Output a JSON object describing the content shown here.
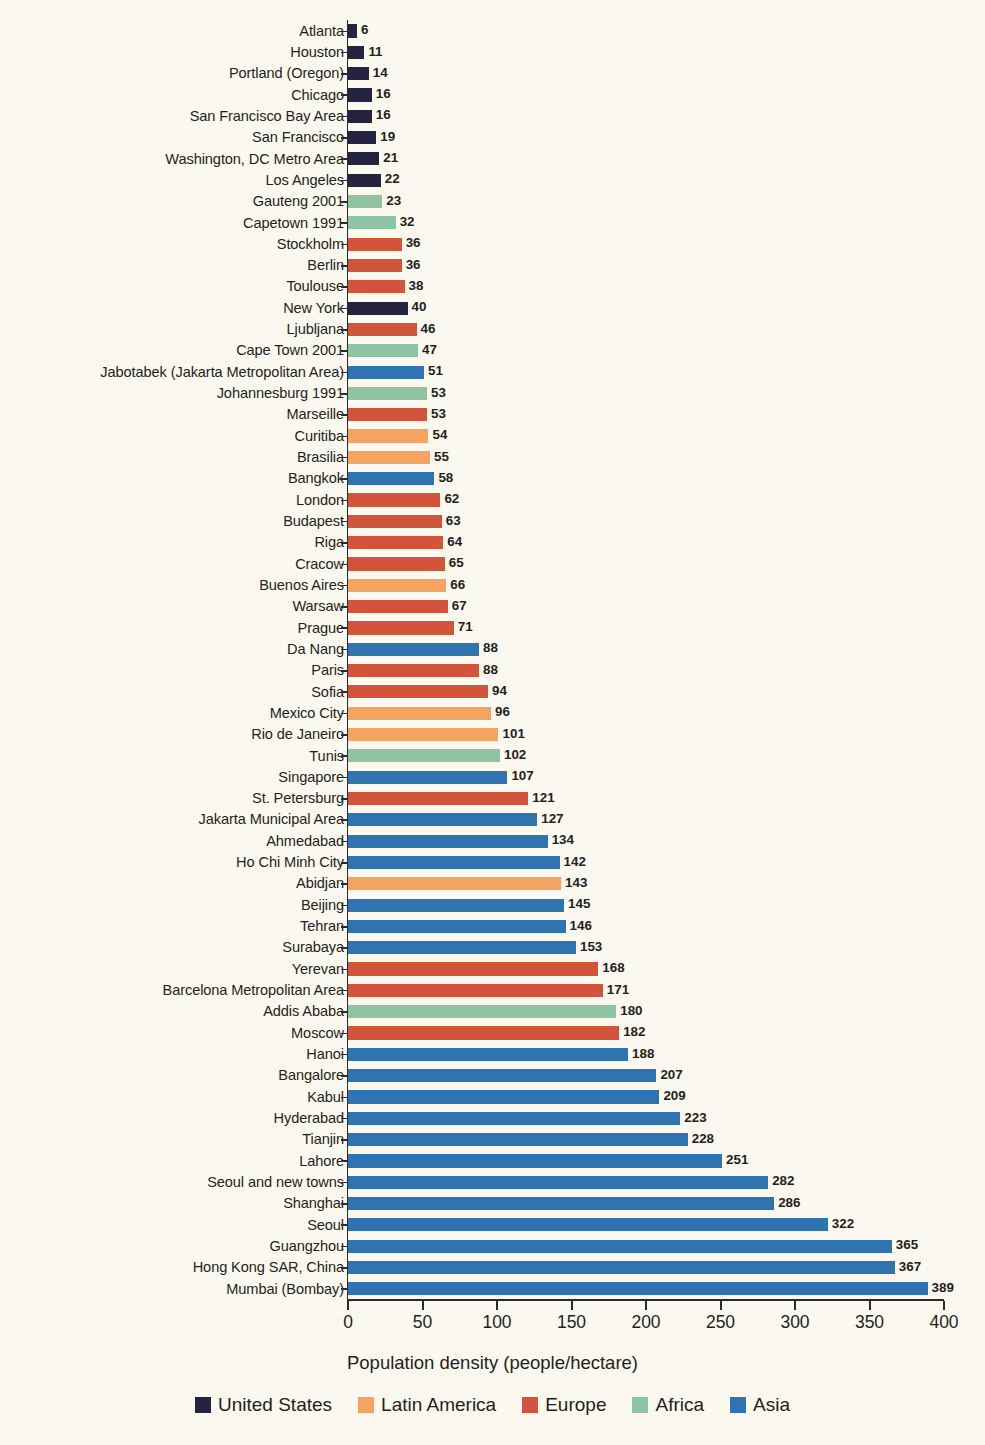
{
  "chart_data": {
    "type": "bar",
    "orientation": "horizontal",
    "title": "",
    "xlabel": "Population density (people/hectare)",
    "ylabel": "",
    "xlim": [
      0,
      400
    ],
    "xticks": [
      0,
      50,
      100,
      150,
      200,
      250,
      300,
      350,
      400
    ],
    "grid": false,
    "legend_position": "bottom",
    "categories": [
      "Atlanta",
      "Houston",
      "Portland (Oregon)",
      "Chicago",
      "San Francisco Bay Area",
      "San Francisco",
      "Washington, DC Metro Area",
      "Los Angeles",
      "Gauteng 2001",
      "Capetown 1991",
      "Stockholm",
      "Berlin",
      "Toulouse",
      "New York",
      "Ljubljana",
      "Cape Town 2001",
      "Jabotabek (Jakarta Metropolitan Area)",
      "Johannesburg 1991",
      "Marseille",
      "Curitiba",
      "Brasilia",
      "Bangkok",
      "London",
      "Budapest",
      "Riga",
      "Cracow",
      "Buenos Aires",
      "Warsaw",
      "Prague",
      "Da Nang",
      "Paris",
      "Sofia",
      "Mexico City",
      "Rio de Janeiro",
      "Tunis",
      "Singapore",
      "St. Petersburg",
      "Jakarta Municipal Area",
      "Ahmedabad",
      "Ho Chi Minh City",
      "Abidjan",
      "Beijing",
      "Tehran",
      "Surabaya",
      "Yerevan",
      "Barcelona Metropolitan Area",
      "Addis Ababa",
      "Moscow",
      "Hanoi",
      "Bangalore",
      "Kabul",
      "Hyderabad",
      "Tianjin",
      "Lahore",
      "Seoul and new towns",
      "Shanghai",
      "Seoul",
      "Guangzhou",
      "Hong Kong SAR, China",
      "Mumbai (Bombay)"
    ],
    "values": [
      6,
      11,
      14,
      16,
      16,
      19,
      21,
      22,
      23,
      32,
      36,
      36,
      38,
      40,
      46,
      47,
      51,
      53,
      53,
      54,
      55,
      58,
      62,
      63,
      64,
      65,
      66,
      67,
      71,
      88,
      88,
      94,
      96,
      101,
      102,
      107,
      121,
      127,
      134,
      142,
      143,
      145,
      146,
      153,
      168,
      171,
      180,
      182,
      188,
      207,
      209,
      223,
      228,
      251,
      282,
      286,
      322,
      365,
      367,
      389
    ],
    "groups": [
      "United States",
      "United States",
      "United States",
      "United States",
      "United States",
      "United States",
      "United States",
      "United States",
      "Africa",
      "Africa",
      "Europe",
      "Europe",
      "Europe",
      "United States",
      "Europe",
      "Africa",
      "Asia",
      "Africa",
      "Europe",
      "Latin America",
      "Latin America",
      "Asia",
      "Europe",
      "Europe",
      "Europe",
      "Europe",
      "Latin America",
      "Europe",
      "Europe",
      "Asia",
      "Europe",
      "Europe",
      "Latin America",
      "Latin America",
      "Africa",
      "Asia",
      "Europe",
      "Asia",
      "Asia",
      "Asia",
      "Latin America",
      "Asia",
      "Asia",
      "Asia",
      "Europe",
      "Europe",
      "Africa",
      "Europe",
      "Asia",
      "Asia",
      "Asia",
      "Asia",
      "Asia",
      "Asia",
      "Asia",
      "Asia",
      "Asia",
      "Asia",
      "Asia",
      "Asia"
    ],
    "legend": [
      {
        "label": "United States",
        "color": "#25243f"
      },
      {
        "label": "Latin America",
        "color": "#f5a361"
      },
      {
        "label": "Europe",
        "color": "#d2543a"
      },
      {
        "label": "Africa",
        "color": "#8ec4a1"
      },
      {
        "label": "Asia",
        "color": "#2f74b1"
      }
    ],
    "colors": {
      "United States": "#25243f",
      "Latin America": "#f5a361",
      "Europe": "#d2543a",
      "Africa": "#8ec4a1",
      "Asia": "#2f74b1"
    }
  }
}
